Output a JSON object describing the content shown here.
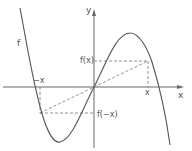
{
  "diagram": {
    "labels": {
      "function": "f",
      "y_axis": "y",
      "x_axis": "x",
      "x_tick": "x",
      "neg_x_tick": "−x",
      "fx": "f(x)",
      "f_neg_x": "f(−x)"
    },
    "colors": {
      "curve": "#555555",
      "axes": "#666666",
      "dashed": "#777777",
      "text": "#555555"
    }
  }
}
